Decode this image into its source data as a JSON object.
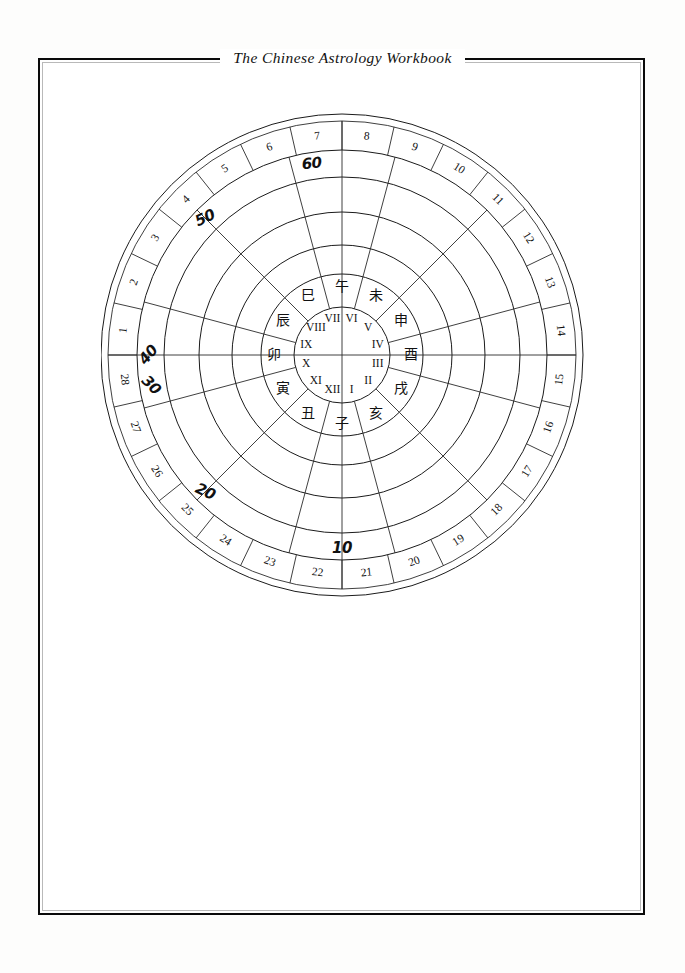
{
  "page": {
    "title": "The Chinese Astrology Workbook",
    "border_color": "#0a0a0a",
    "background": "#ffffff",
    "ink_color": "#111111"
  },
  "diagram": {
    "name": "chinese-astrology-chart-wheel",
    "center": {
      "x": 241,
      "y": 242
    },
    "rings": [
      {
        "name": "outer-rim-outer",
        "radius": 241
      },
      {
        "name": "outer-rim-inner",
        "radius": 234
      },
      {
        "name": "mansions-ring-inner",
        "radius": 205
      },
      {
        "name": "decades-ring-inner",
        "radius": 178
      },
      {
        "name": "ring-4",
        "radius": 143
      },
      {
        "name": "ring-5",
        "radius": 110
      },
      {
        "name": "branches-ring-outer",
        "radius": 81
      },
      {
        "name": "roman-ring-outer",
        "radius": 48
      }
    ],
    "lunar_mansions": {
      "label": "28 lunar mansions",
      "count": 28,
      "numbers": [
        1,
        2,
        3,
        4,
        5,
        6,
        7,
        8,
        9,
        10,
        11,
        12,
        13,
        14,
        15,
        16,
        17,
        18,
        19,
        20,
        21,
        22,
        23,
        24,
        25,
        26,
        27,
        28
      ]
    },
    "decade_marks": {
      "label": "handwritten decade markers",
      "values": [
        "10",
        "20",
        "30",
        "40",
        "50",
        "60"
      ]
    },
    "earthly_branches": {
      "label": "twelve earthly branches",
      "values": [
        "子",
        "丑",
        "寅",
        "卯",
        "辰",
        "巳",
        "午",
        "未",
        "申",
        "酉",
        "戌",
        "亥"
      ]
    },
    "roman_numerals": {
      "label": "twelve houses",
      "values": [
        "I",
        "II",
        "III",
        "IV",
        "V",
        "VI",
        "VII",
        "VIII",
        "IX",
        "X",
        "XI",
        "XII"
      ]
    },
    "spokes": {
      "count": 12,
      "axis_lines": [
        "horizontal",
        "vertical"
      ]
    }
  }
}
